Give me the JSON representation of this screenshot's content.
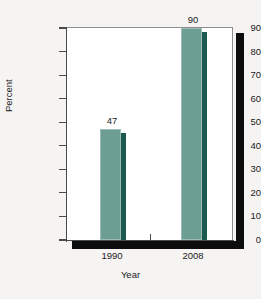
{
  "chart_data": {
    "type": "bar",
    "title": "",
    "categories": [
      "1990",
      "2008"
    ],
    "values": [
      47,
      90
    ],
    "data_labels": [
      "47",
      "90"
    ],
    "xlabel": "Year",
    "ylabel": "Percent",
    "ylim": [
      0,
      90
    ],
    "ytick_labels": [
      "0",
      "10",
      "20",
      "30",
      "40",
      "50",
      "60",
      "70",
      "80",
      "90"
    ],
    "ytick_values": [
      0,
      10,
      20,
      30,
      40,
      50,
      60,
      70,
      80,
      90
    ],
    "grid": false,
    "legend": false,
    "legend_position": "none",
    "series": [
      {
        "name": "Percent",
        "values": [
          47,
          90
        ]
      }
    ],
    "colors": {
      "bar_face": "#6d9e94",
      "bar_side": "#1c5a4f",
      "bar_highlight": "#9cbdb6",
      "axis": "#4a4a4a",
      "frame": "#8d8d8d",
      "shadow": "#0d0d0d",
      "plot_background": "#ffffff",
      "page_background": "#f5f4f2",
      "text": "#1b1b1b"
    }
  }
}
